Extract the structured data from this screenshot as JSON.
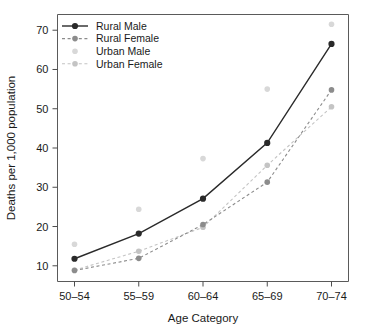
{
  "chart_data": {
    "type": "line",
    "title": "",
    "xlabel": "Age Category",
    "ylabel": "Deaths per 1,000 population",
    "categories": [
      "50–54",
      "55–59",
      "60–64",
      "65–69",
      "70–74"
    ],
    "yticks": [
      10,
      20,
      30,
      40,
      50,
      60,
      70
    ],
    "ylim": [
      6,
      74
    ],
    "grid": false,
    "legend_position": "top-left inside plot",
    "series": [
      {
        "name": "Rural Male",
        "values": [
          11.8,
          18.2,
          27.1,
          41.3,
          66.5
        ],
        "color": "#2a2a2a",
        "linestyle": "solid",
        "marker": "filled-circle",
        "opacity": 1
      },
      {
        "name": "Rural Female",
        "values": [
          8.8,
          11.9,
          20.5,
          31.3,
          54.8
        ],
        "color": "#8c8c8c",
        "linestyle": "dashed",
        "marker": "filled-circle",
        "opacity": 1
      },
      {
        "name": "Urban Male",
        "values": [
          15.5,
          24.4,
          37.3,
          55.0,
          71.5
        ],
        "color": "#d8d8d8",
        "linestyle": "none",
        "marker": "filled-circle",
        "opacity": 1
      },
      {
        "name": "Urban Female",
        "values": [
          8.9,
          13.7,
          19.8,
          35.6,
          50.5
        ],
        "color": "#c4c4c4",
        "linestyle": "dashed",
        "marker": "filled-circle",
        "opacity": 1
      }
    ]
  },
  "legend": {
    "items": [
      {
        "label": "Rural Male"
      },
      {
        "label": "Rural Female"
      },
      {
        "label": "Urban Male"
      },
      {
        "label": "Urban Female"
      }
    ]
  },
  "axes": {
    "x_title": "Age Category",
    "y_title": "Deaths per 1,000 population",
    "x_ticklabels": [
      "50–54",
      "55–59",
      "60–64",
      "65–69",
      "70–74"
    ],
    "y_ticklabels": [
      "10",
      "20",
      "30",
      "40",
      "50",
      "60",
      "70"
    ]
  }
}
